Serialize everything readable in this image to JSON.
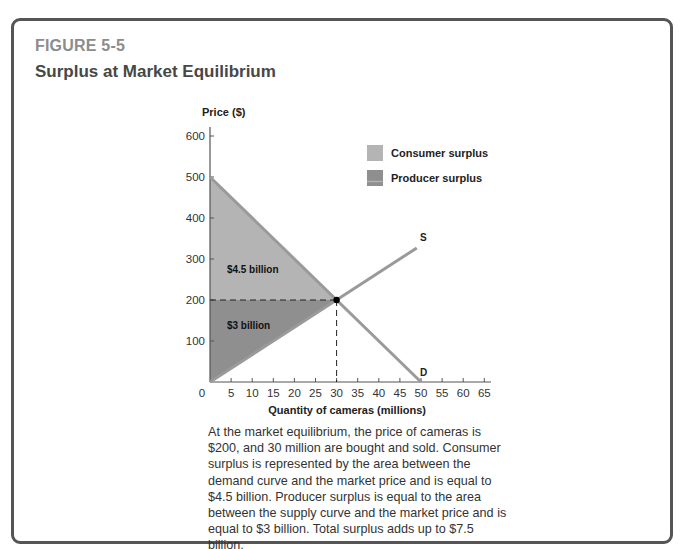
{
  "figure": {
    "number": "FIGURE 5-5",
    "title": "Surplus at Market Equilibrium",
    "caption": "At the market equilibrium, the price of cameras is $200, and 30 million are bought and sold. Consumer surplus is represented by the area between the demand curve and the market price and is equal to $4.5 billion. Producer surplus is equal to the area between the supply curve and the market price and is equal to $3 billion. Total surplus adds up to $7.5 billion."
  },
  "colors": {
    "consumer_surplus": "#b4b4b4",
    "producer_surplus": "#8f8f8f",
    "curve": "#9a9a9a",
    "axis": "#555555",
    "equilibrium_point": "#000000"
  },
  "chart_data": {
    "type": "area",
    "title": "Surplus at Market Equilibrium",
    "xlabel": "Quantity of cameras (millions)",
    "ylabel": "Price ($)",
    "xlim": [
      0,
      65
    ],
    "ylim": [
      0,
      600
    ],
    "x_ticks": [
      5,
      10,
      15,
      20,
      25,
      30,
      35,
      40,
      45,
      50,
      55,
      60,
      65
    ],
    "x_origin_label": "0",
    "y_ticks": [
      100,
      200,
      300,
      400,
      500,
      600
    ],
    "grid": false,
    "series": [
      {
        "name": "D",
        "kind": "line",
        "points": [
          [
            0,
            500
          ],
          [
            50,
            0
          ]
        ]
      },
      {
        "name": "S",
        "kind": "line",
        "points": [
          [
            0,
            0
          ],
          [
            49,
            327
          ]
        ]
      }
    ],
    "areas": [
      {
        "name": "Consumer surplus",
        "label": "$4.5 billion",
        "label_at": [
          4,
          265
        ],
        "polygon": [
          [
            0,
            500
          ],
          [
            30,
            200
          ],
          [
            0,
            200
          ]
        ]
      },
      {
        "name": "Producer surplus",
        "label": "$3 billion",
        "label_at": [
          4,
          130
        ],
        "polygon": [
          [
            0,
            200
          ],
          [
            30,
            200
          ],
          [
            0,
            0
          ]
        ]
      }
    ],
    "equilibrium": {
      "quantity": 30,
      "price": 200
    },
    "curve_labels": [
      {
        "text": "S",
        "at": [
          50,
          345
        ]
      },
      {
        "text": "D",
        "at": [
          50,
          15
        ]
      }
    ],
    "legend": {
      "position": "top-right",
      "entries": [
        {
          "label": "Consumer surplus",
          "key": "consumer_surplus"
        },
        {
          "label": "Producer surplus",
          "key": "producer_surplus"
        }
      ]
    }
  }
}
